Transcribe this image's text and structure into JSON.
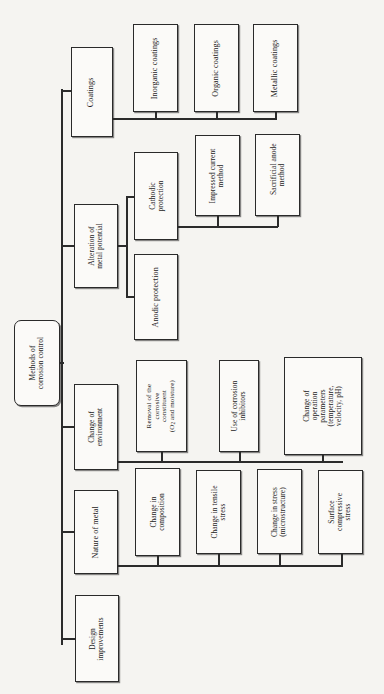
{
  "diagram": {
    "title": "Methods of corrosion control",
    "type": "tree-flowchart",
    "orientation": "rotated-90ccw",
    "root": {
      "id": "root",
      "label": "Methods of\ncorrosion control"
    },
    "branches": [
      {
        "id": "coatings",
        "label": "Coatings",
        "children": [
          {
            "id": "inorganic-coatings",
            "label": "Inorganic coatings"
          },
          {
            "id": "organic-coatings",
            "label": "Organic coatings"
          },
          {
            "id": "metallic-coatings",
            "label": "Metallic coatings"
          }
        ]
      },
      {
        "id": "alteration-of-metal-potential",
        "label": "Alteration of\nmetal potential",
        "children": [
          {
            "id": "cathodic-protection",
            "label": "Cathodic\nprotection",
            "children": [
              {
                "id": "impressed-current-method",
                "label": "Impressed current\nmethod"
              },
              {
                "id": "sacrificial-anode-method",
                "label": "Sacrificial anode\nmethod"
              }
            ]
          },
          {
            "id": "anodic-protection",
            "label": "Anodic protection"
          }
        ]
      },
      {
        "id": "change-of-environment",
        "label": "Change of\nenvironment",
        "children": [
          {
            "id": "removal-of-corrosive-constituent",
            "label_part1": "Removal of the\ncorrosive\nconstituent\n(O",
            "label_sub": "2",
            "label_part2": " and moisture)"
          },
          {
            "id": "use-of-corrosion-inhibitors",
            "label": "Use of corrosion\ninhibitors"
          },
          {
            "id": "change-of-operation-parameters",
            "label": "Change of\noperation\nparameters\n(temperature,\nvelocity, pH)"
          }
        ]
      },
      {
        "id": "nature-of-metal",
        "label": "Nature of metal",
        "children": [
          {
            "id": "change-in-composition",
            "label": "Change in\ncomposition"
          },
          {
            "id": "change-in-tensile-stress",
            "label": "Change in tensile\nstress"
          },
          {
            "id": "change-in-stress-microstructure",
            "label": "Change in stress\n(microstructure)"
          },
          {
            "id": "surface-compressive-stress",
            "label": "Surface\ncompressive\nstress"
          }
        ]
      },
      {
        "id": "design-improvements",
        "label": "Design\nimprovements"
      }
    ],
    "colors": {
      "background": "#f5f4f1",
      "box_fill": "#fbfaf8",
      "line": "#2b2b2b",
      "text": "#1b1b1b"
    }
  }
}
